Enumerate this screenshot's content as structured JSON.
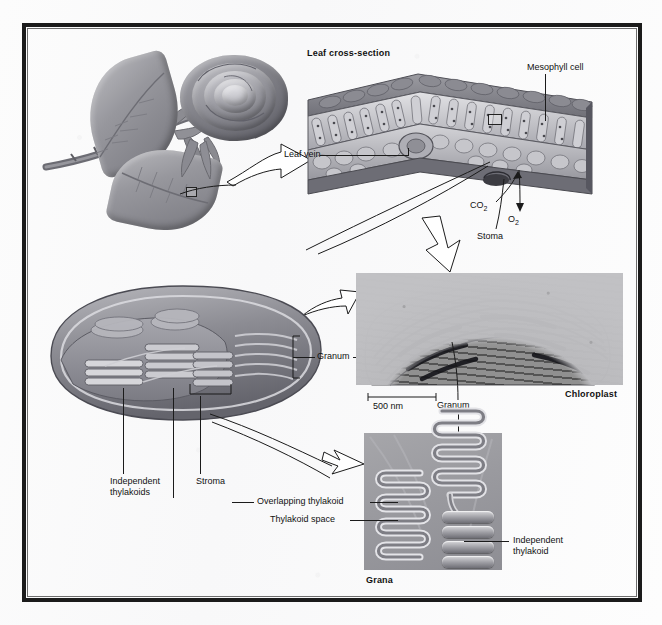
{
  "figure": {
    "background_color": "#fdfdfd",
    "frame_color": "#1b1b1b",
    "ink_color": "#111111"
  },
  "labels": {
    "leaf_cross_section": "Leaf cross-section",
    "mesophyll_cell": "Mesophyll cell",
    "leaf_vein": "Leaf vein",
    "co2": "CO",
    "co2_sub": "2",
    "o2": "O",
    "o2_sub": "2",
    "stoma": "Stoma",
    "granum_illustration": "Granum",
    "granum_micrograph": "Granum",
    "independent_thylakoids": "Independent\nthylakoids",
    "independent_thylakoids_line1": "Independent",
    "independent_thylakoids_line2": "thylakoids",
    "stroma": "Stroma",
    "scale_bar": "500 nm",
    "chloroplast": "Chloroplast",
    "overlapping_thylakoid": "Overlapping thylakoid",
    "thylakoid_space": "Thylakoid space",
    "independent_thylakoid_line1": "Independent",
    "independent_thylakoid_line2": "thylakoid",
    "grana": "Grana"
  },
  "panels": {
    "rose": {
      "name": "rose-plant-illustration",
      "caption": ""
    },
    "leaf_cross_section": {
      "name": "leaf-cross-section-illustration"
    },
    "chloroplast_illustration": {
      "name": "chloroplast-cutaway-illustration"
    },
    "electron_micrograph": {
      "name": "chloroplast-electron-micrograph",
      "scale": "500 nm",
      "caption": "Chloroplast"
    },
    "grana_detail": {
      "name": "grana-detail-illustration",
      "caption": "Grana"
    }
  }
}
